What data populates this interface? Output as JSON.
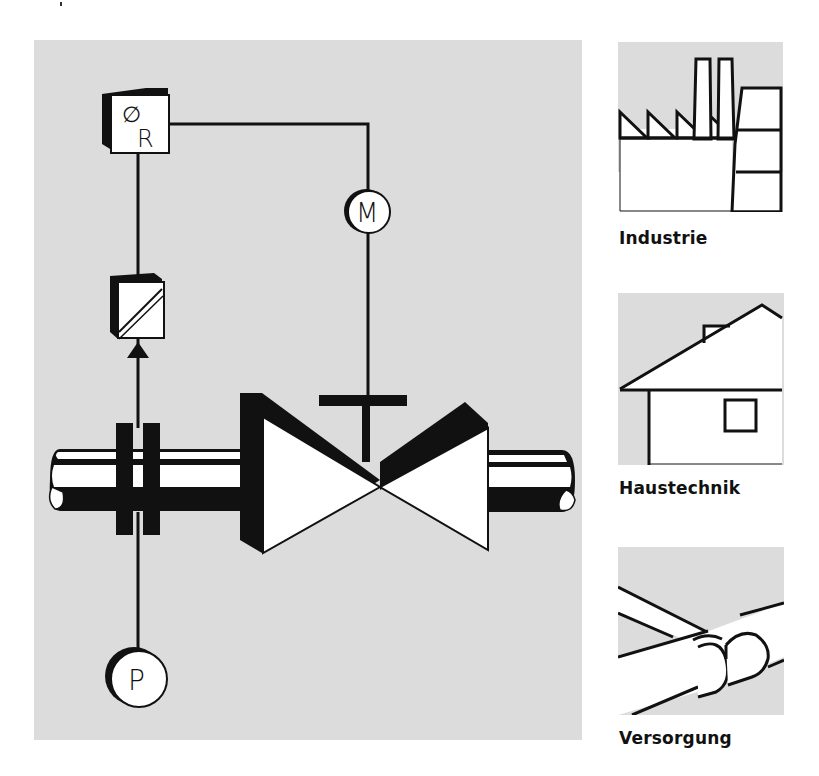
{
  "diagram": {
    "type": "process-control-schematic",
    "colors": {
      "panel": "#dcdcdc",
      "ink": "#111111",
      "fill": "#ffffff"
    },
    "main": {
      "controller": {
        "symbol": "∅",
        "letter": "R",
        "role": "controller"
      },
      "actuator": {
        "letter": "M",
        "role": "motor"
      },
      "transmitter": {
        "role": "signal-converter"
      },
      "sensor": {
        "letter": "P",
        "role": "pressure"
      },
      "valve": {
        "role": "control-valve"
      },
      "pipe": {
        "role": "pipeline"
      },
      "orifice": {
        "role": "orifice-plate-flange"
      }
    },
    "applications": [
      {
        "id": "industrie",
        "label": "Industrie",
        "icon": "factory-icon"
      },
      {
        "id": "haustechnik",
        "label": "Haustechnik",
        "icon": "house-icon"
      },
      {
        "id": "versorgung",
        "label": "Versorgung",
        "icon": "pipes-icon"
      }
    ]
  }
}
